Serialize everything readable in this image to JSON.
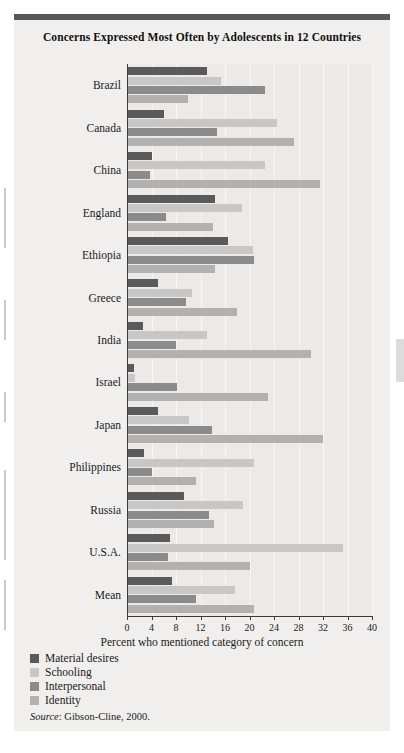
{
  "figure": {
    "title": "Concerns Expressed Most Often by Adolescents in 12 Countries",
    "source_label": "Source",
    "source_text": ": Gibson-Cline, 2000."
  },
  "chart_data": {
    "type": "bar",
    "orientation": "horizontal",
    "grouped": true,
    "title": "Concerns Expressed Most Often by Adolescents in 12 Countries",
    "xlabel": "Percent who mentioned category of concern",
    "ylabel": "",
    "xlim": [
      0,
      40
    ],
    "xticks": [
      0,
      4,
      8,
      12,
      16,
      20,
      24,
      28,
      32,
      36,
      40
    ],
    "grid": true,
    "legend_position": "below-left",
    "categories": [
      "Brazil",
      "Canada",
      "China",
      "England",
      "Ethiopia",
      "Greece",
      "India",
      "Israel",
      "Japan",
      "Philippines",
      "Russia",
      "U.S.A.",
      "Mean"
    ],
    "series": [
      {
        "name": "Material desires",
        "color": "#5a5a5a",
        "values": [
          13.0,
          6.0,
          4.0,
          14.4,
          16.5,
          5.0,
          2.6,
          1.2,
          5.0,
          2.8,
          9.3,
          7.0,
          7.4
        ]
      },
      {
        "name": "Schooling",
        "color": "#c9c7c5",
        "values": [
          15.4,
          24.5,
          22.5,
          18.8,
          20.6,
          10.6,
          13.0,
          1.3,
          10.2,
          20.8,
          19.0,
          35.3,
          17.6
        ]
      },
      {
        "name": "Interpersonal",
        "color": "#8b8b8b",
        "values": [
          22.5,
          14.7,
          3.8,
          6.4,
          20.8,
          9.6,
          8.0,
          8.2,
          13.8,
          4.0,
          13.4,
          6.7,
          11.3
        ]
      },
      {
        "name": "Identity",
        "color": "#b3b1af",
        "values": [
          10.0,
          27.3,
          31.5,
          14.0,
          14.4,
          18.0,
          30.0,
          23.0,
          32.0,
          11.3,
          14.2,
          20.0,
          20.8
        ]
      }
    ]
  },
  "legend": {
    "items": [
      {
        "label": "Material desires",
        "color": "#5a5a5a"
      },
      {
        "label": "Schooling",
        "color": "#c9c7c5"
      },
      {
        "label": "Interpersonal",
        "color": "#8b8b8b"
      },
      {
        "label": "Identity",
        "color": "#b3b1af"
      }
    ]
  }
}
